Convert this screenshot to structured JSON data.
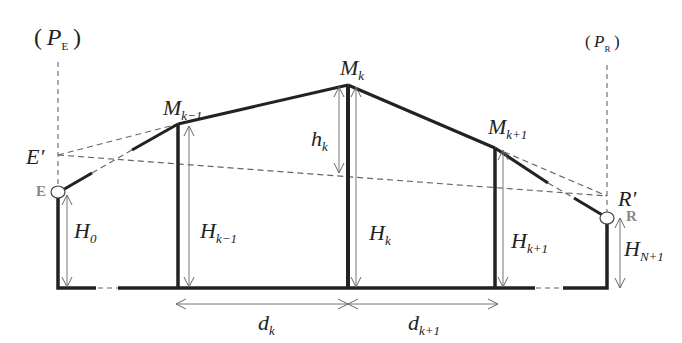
{
  "diagram": {
    "type": "cross-section profile",
    "planes": {
      "left": {
        "label": "P",
        "sub": "E"
      },
      "right": {
        "label": "P",
        "sub": "R"
      }
    },
    "endpoints": {
      "emitter": {
        "label": "E",
        "projected": "E'"
      },
      "receiver": {
        "label": "R",
        "projected": "R'"
      }
    },
    "peaks": [
      {
        "label": "M",
        "sub": "k−1"
      },
      {
        "label": "M",
        "sub": "k"
      },
      {
        "label": "M",
        "sub": "k+1"
      }
    ],
    "heights": [
      {
        "label": "H",
        "sub": "0"
      },
      {
        "label": "H",
        "sub": "k−1"
      },
      {
        "label": "H",
        "sub": "k"
      },
      {
        "label": "H",
        "sub": "k+1"
      },
      {
        "label": "H",
        "sub": "N+1"
      }
    ],
    "clearance": {
      "label": "h",
      "sub": "k"
    },
    "distances": [
      {
        "label": "d",
        "sub": "k"
      },
      {
        "label": "d",
        "sub": "k+1"
      }
    ]
  }
}
